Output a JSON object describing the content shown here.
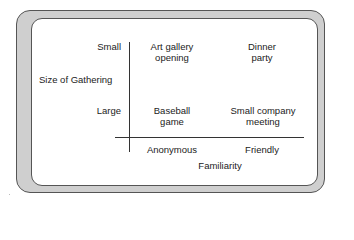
{
  "diagram": {
    "y_axis": {
      "title": "Size of Gathering",
      "ticks": [
        "Small",
        "Large"
      ]
    },
    "x_axis": {
      "title": "Familiarity",
      "ticks": [
        "Anonymous",
        "Friendly"
      ]
    },
    "cells": {
      "small_anonymous": [
        "Art gallery",
        "opening"
      ],
      "small_friendly": [
        "Dinner",
        "party"
      ],
      "large_anonymous": [
        "Baseball",
        "game"
      ],
      "large_friendly": [
        "Small company",
        "meeting"
      ]
    },
    "colors": {
      "frame": "#cfcfcf",
      "frame_border": "#555555",
      "panel": "#ffffff",
      "axis": "#333333",
      "text": "#222222"
    }
  }
}
